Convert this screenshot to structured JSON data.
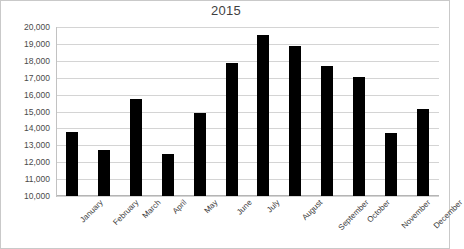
{
  "chart_data": {
    "type": "bar",
    "title": "2015",
    "xlabel": "",
    "ylabel": "",
    "categories": [
      "January",
      "February",
      "March",
      "April",
      "May",
      "June",
      "July",
      "August",
      "September",
      "October",
      "November",
      "December"
    ],
    "values": [
      13800,
      12700,
      15750,
      12500,
      14900,
      17850,
      19500,
      18900,
      17700,
      17050,
      13720,
      15150
    ],
    "ylim": [
      10000,
      20000
    ],
    "y_ticks": [
      10000,
      11000,
      12000,
      13000,
      14000,
      15000,
      16000,
      17000,
      18000,
      19000,
      20000
    ],
    "y_tick_labels": [
      "10,000",
      "11,000",
      "12,000",
      "13,000",
      "14,000",
      "15,000",
      "16,000",
      "17,000",
      "18,000",
      "19,000",
      "20,000"
    ],
    "grid": true,
    "legend": false,
    "legend_position": "none",
    "series": [
      {
        "name": "2015",
        "color": "#000000",
        "values": [
          13800,
          12700,
          15750,
          12500,
          14900,
          17850,
          19500,
          18900,
          17700,
          17050,
          13720,
          15150
        ]
      }
    ],
    "colors": {
      "bar": "#000000",
      "grid": "#d4d4d4",
      "axis": "#b5b5b5",
      "text": "#3f3f3f",
      "background": "#ffffff",
      "border": "#c9c9c9"
    }
  }
}
